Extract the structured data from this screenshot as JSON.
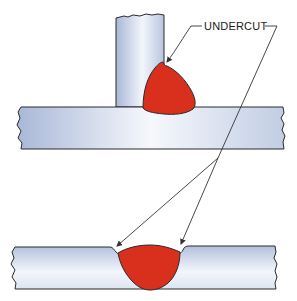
{
  "figure": {
    "label": "UNDERCUT",
    "colors": {
      "weld": "#d9301e",
      "plate_edge": "#a9b8d8",
      "plate_mid": "#f4f6fb",
      "outline": "#2a2a2a",
      "leader": "#333333",
      "background": "#ffffff"
    },
    "parts": [
      {
        "id": "top-joint",
        "type": "T-joint fillet weld",
        "defect": "undercut at toe on vertical member"
      },
      {
        "id": "bottom-joint",
        "type": "butt weld (groove)",
        "defect": "undercut at both toes on plate surface"
      }
    ]
  }
}
